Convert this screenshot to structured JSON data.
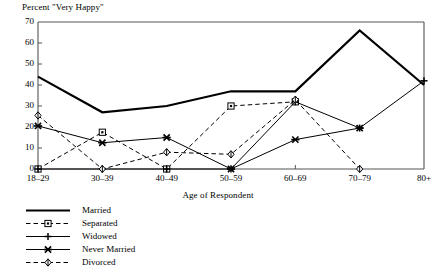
{
  "chart_data": {
    "type": "line",
    "title": "Percent \"Very Happy\"",
    "xlabel": "Age of Respondent",
    "ylabel": "",
    "categories": [
      "18–29",
      "30–39",
      "40–49",
      "50–59",
      "60–69",
      "70–79",
      "80+"
    ],
    "ylim": [
      0,
      70
    ],
    "yticks": [
      "0",
      "10",
      "20",
      "30",
      "40",
      "50",
      "60",
      "70"
    ],
    "grid": false,
    "legend_position": "below-left",
    "series": [
      {
        "name": "Married",
        "marker": "none",
        "line": "solid",
        "width": 2.2,
        "values": [
          44,
          27,
          30,
          37,
          37,
          66,
          40
        ]
      },
      {
        "name": "Separated",
        "marker": "square",
        "line": "dashed",
        "width": 1.0,
        "values": [
          0,
          17.5,
          0,
          30,
          32,
          null,
          null
        ]
      },
      {
        "name": "Widowed",
        "marker": "plus",
        "line": "solid",
        "width": 1.0,
        "values": [
          0,
          0,
          0,
          0,
          32,
          19.5,
          42
        ]
      },
      {
        "name": "Never Married",
        "marker": "cross",
        "line": "solid",
        "width": 1.0,
        "values": [
          20.5,
          12.5,
          15,
          0,
          14,
          19.5,
          null
        ]
      },
      {
        "name": "Divorced",
        "marker": "diamond",
        "line": "dashed",
        "width": 1.0,
        "values": [
          25.5,
          0,
          8,
          7,
          33,
          0,
          null
        ]
      }
    ],
    "colors": {
      "ink": "#000000",
      "axis": "#555555",
      "background": "#ffffff"
    }
  }
}
